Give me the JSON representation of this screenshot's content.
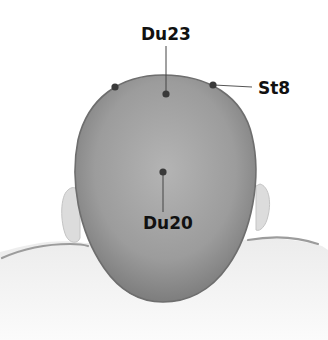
{
  "diagram": {
    "points": [
      {
        "id": "du23",
        "label": "Du23"
      },
      {
        "id": "st8",
        "label": "St8"
      },
      {
        "id": "du20",
        "label": "Du20"
      }
    ],
    "colors": {
      "head": "#9a9a9a",
      "head_edge": "#6e6e6e",
      "point": "#3a3a3a",
      "leader_line": "#444444",
      "label": "#111111",
      "shoulders": "#eeeeee"
    }
  }
}
